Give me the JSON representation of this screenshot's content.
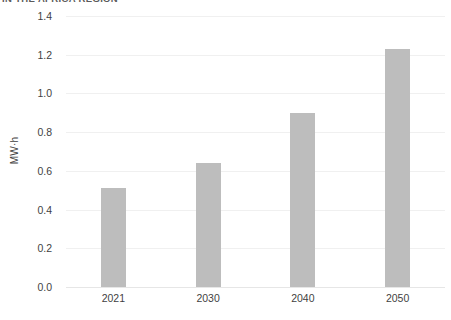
{
  "chart_data": {
    "type": "bar",
    "title": "IN THE AFRICA REGION",
    "xlabel": "",
    "ylabel": "MW·h",
    "categories": [
      "2021",
      "2030",
      "2040",
      "2050"
    ],
    "values": [
      0.51,
      0.64,
      0.9,
      1.23
    ],
    "ylim": [
      0.0,
      1.4
    ],
    "ytick_labels": [
      "0.0",
      "0.2",
      "0.4",
      "0.6",
      "0.8",
      "1.0",
      "1.2",
      "1.4"
    ],
    "ytick_values": [
      0.0,
      0.2,
      0.4,
      0.6,
      0.8,
      1.0,
      1.2,
      1.4
    ],
    "grid": true,
    "legend": false,
    "legend_position": "none",
    "colors": {
      "bar": "#bdbdbd",
      "gridline": "#f0f0f0",
      "baseline": "#e6e6e6",
      "text": "#3f3f3f",
      "title": "#5a5a5a",
      "background": "#ffffff"
    }
  }
}
